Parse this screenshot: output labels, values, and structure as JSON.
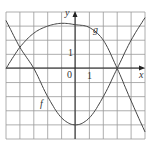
{
  "chart_data": {
    "type": "line",
    "title": "",
    "xlabel": "x",
    "ylabel": "y",
    "xlim": [
      -5,
      5
    ],
    "ylim": [
      -5,
      4
    ],
    "grid": true,
    "tick_labels": {
      "origin": "0",
      "x_unit": "1",
      "y_unit": "1"
    },
    "series": [
      {
        "name": "f",
        "x": [
          -5,
          -4,
          -3,
          -2,
          -1,
          0,
          1,
          2,
          3,
          4,
          5
        ],
        "y": [
          3.4,
          1.5,
          0,
          -2,
          -3.5,
          -4,
          -3.5,
          -2,
          0,
          2,
          3.6
        ]
      },
      {
        "name": "g",
        "x": [
          -5,
          -4,
          -3,
          -2,
          -1,
          0,
          1,
          2,
          3,
          4,
          5
        ],
        "y": [
          0,
          1.5,
          2.5,
          3,
          3.2,
          3.1,
          2.9,
          2,
          0,
          -2.3,
          -4.5
        ]
      }
    ]
  },
  "labels": {
    "x_axis": "x",
    "y_axis": "y",
    "origin": "0",
    "x_one": "1",
    "y_one": "1",
    "f": "f",
    "g": "g"
  }
}
